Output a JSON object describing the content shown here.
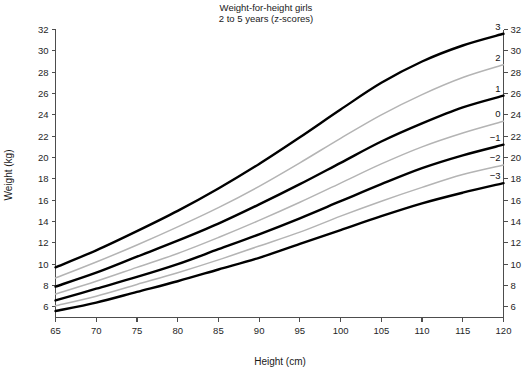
{
  "chart_data": {
    "type": "line",
    "title": "Weight-for-height girls",
    "subtitle": "2 to 5 years (z-scores)",
    "xlabel": "Height (cm)",
    "ylabel": "Weight (kg)",
    "xlim": [
      65,
      120
    ],
    "ylim": [
      5,
      32
    ],
    "grid": false,
    "legend_position": "right-inline-curve-labels",
    "xticks": [
      65,
      70,
      75,
      80,
      85,
      90,
      95,
      100,
      105,
      110,
      115,
      120
    ],
    "yticks": [
      6,
      8,
      10,
      12,
      14,
      16,
      18,
      20,
      22,
      24,
      26,
      28,
      30,
      32
    ],
    "yticks_right": [
      6,
      8,
      10,
      12,
      14,
      16,
      18,
      20,
      22,
      24,
      26,
      28,
      30,
      32
    ],
    "x": [
      65,
      70,
      75,
      80,
      85,
      90,
      95,
      100,
      105,
      110,
      115,
      120
    ],
    "series": [
      {
        "name": "3",
        "label": "3",
        "style": "major",
        "color": "#000000",
        "values": [
          9.7,
          11.3,
          13.1,
          15.0,
          17.1,
          19.4,
          21.9,
          24.5,
          27.0,
          29.0,
          30.5,
          31.6
        ]
      },
      {
        "name": "2",
        "label": "2",
        "style": "minor",
        "color": "#b4b4b4",
        "values": [
          8.7,
          10.2,
          11.8,
          13.5,
          15.3,
          17.3,
          19.5,
          21.8,
          24.0,
          25.9,
          27.5,
          28.7
        ]
      },
      {
        "name": "1",
        "label": "1",
        "style": "major",
        "color": "#000000",
        "values": [
          7.9,
          9.2,
          10.7,
          12.2,
          13.8,
          15.6,
          17.5,
          19.5,
          21.5,
          23.2,
          24.7,
          25.8
        ]
      },
      {
        "name": "0",
        "label": "0",
        "style": "minor",
        "color": "#b4b4b4",
        "values": [
          7.2,
          8.4,
          9.7,
          11.0,
          12.5,
          14.1,
          15.8,
          17.6,
          19.4,
          21.0,
          22.3,
          23.4
        ]
      },
      {
        "name": "-1",
        "label": "−1",
        "style": "major",
        "color": "#000000",
        "values": [
          6.6,
          7.7,
          8.8,
          10.0,
          11.4,
          12.8,
          14.3,
          15.9,
          17.5,
          19.0,
          20.2,
          21.2
        ]
      },
      {
        "name": "-2",
        "label": "−2",
        "style": "minor",
        "color": "#b4b4b4",
        "values": [
          6.1,
          7.0,
          8.1,
          9.2,
          10.4,
          11.7,
          13.0,
          14.5,
          15.9,
          17.2,
          18.4,
          19.3
        ]
      },
      {
        "name": "-3",
        "label": "−3",
        "style": "major",
        "color": "#000000",
        "values": [
          5.6,
          6.4,
          7.4,
          8.4,
          9.5,
          10.6,
          11.9,
          13.2,
          14.5,
          15.7,
          16.7,
          17.6
        ]
      }
    ]
  },
  "colors": {
    "background": "#ffffff",
    "axis": "#4d4d4d",
    "major_curve": "#000000",
    "minor_curve": "#b4b4b4",
    "text": "#1a1a1a"
  }
}
